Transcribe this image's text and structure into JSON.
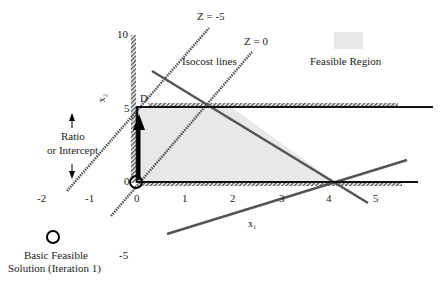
{
  "diagram": {
    "type": "linear-programming-graph",
    "axes": {
      "x_label": "x₁",
      "y_label": "x₂",
      "x_ticks": [
        "-2",
        "-1",
        "0",
        "1",
        "2",
        "3",
        "4",
        "5"
      ],
      "y_ticks": [
        "10",
        "5",
        "0",
        "-5"
      ]
    },
    "isocost": {
      "label": "Isocost lines",
      "line1_label": "Z = -5",
      "line2_label": "Z = 0"
    },
    "legend": {
      "feasible_region": "Feasible Region",
      "basic_feasible_solution_line1": "Basic Feasible",
      "basic_feasible_solution_line2": "Solution (Iteration 1)"
    },
    "annotations": {
      "ratio_line1": "Ratio",
      "ratio_line2": "or Intercept",
      "point_d": "D"
    },
    "colors": {
      "feasible_fill": "#e6e6e6",
      "line": "#111111",
      "constraint": "#444444"
    }
  }
}
